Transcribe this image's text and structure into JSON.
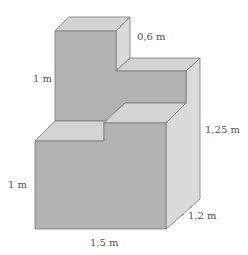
{
  "figure": {
    "type": "3D solid composed of rectangular blocks",
    "colors": {
      "front": "#b3b3b3",
      "top": "#d4d4d4",
      "side": "#dadada",
      "edge": "#7a7a7a"
    },
    "labels": {
      "top_depth": "0,6 m",
      "upper_height": "1 m",
      "total_right_height": "1,25 m",
      "lower_height": "1 m",
      "depth": "1,2 m",
      "width": "1,5 m"
    }
  }
}
